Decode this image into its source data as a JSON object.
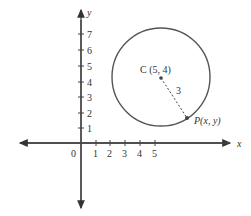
{
  "axes": {
    "x_label": "x",
    "y_label": "y",
    "origin_label": "0",
    "x_ticks": [
      "1",
      "2",
      "3",
      "4",
      "5"
    ],
    "y_ticks": [
      "1",
      "2",
      "3",
      "4",
      "5",
      "6",
      "7"
    ]
  },
  "circle": {
    "center_label": "C (5, 4)",
    "radius_label": "3",
    "point_label": "P(x, y)"
  },
  "colors": {
    "axis": "#444444",
    "circle": "#555555"
  }
}
